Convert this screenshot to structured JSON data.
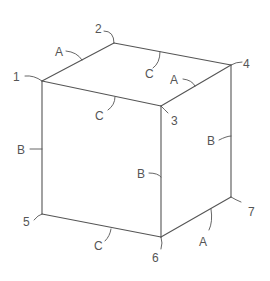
{
  "diagram": {
    "vertices": [
      {
        "id": "1",
        "label": "1"
      },
      {
        "id": "2",
        "label": "2"
      },
      {
        "id": "3",
        "label": "3"
      },
      {
        "id": "4",
        "label": "4"
      },
      {
        "id": "5",
        "label": "5"
      },
      {
        "id": "6",
        "label": "6"
      },
      {
        "id": "7",
        "label": "7"
      }
    ],
    "edge_labels": {
      "e12": "A",
      "e24": "C",
      "e34": "A",
      "e13": "C",
      "e15": "B",
      "e36": "B",
      "e47": "B",
      "e56": "C",
      "e67": "A"
    },
    "colors": {
      "line": "#555555",
      "background": "#ffffff"
    }
  }
}
